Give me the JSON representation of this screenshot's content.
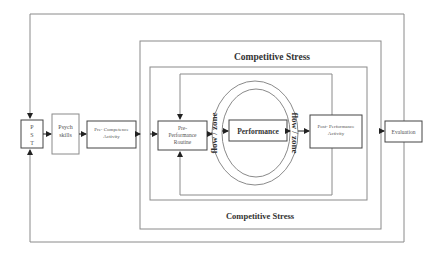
{
  "diagram": {
    "colors": {
      "line": "#8a8a8a",
      "box": "#444444",
      "text": "#555555",
      "bold_text": "#333333",
      "background": "#ffffff"
    },
    "stress_top_label": "Competitive Stress",
    "stress_bottom_label": "Competitive Stress",
    "boxes": {
      "pst": {
        "lines": [
          "P",
          "S",
          "T"
        ]
      },
      "psych": {
        "lines": [
          "Psych",
          "skills"
        ]
      },
      "pre_competence": {
        "lines": [
          "Pre- Competence",
          "Activity"
        ]
      },
      "pre_performance": {
        "lines": [
          "Pre-",
          "Performance",
          "Routine"
        ]
      },
      "performance": {
        "label": "Performance"
      },
      "post_performance": {
        "lines": [
          "Post- Performance",
          "Activity"
        ]
      },
      "evaluation": {
        "label": "Evaluation"
      }
    },
    "flow_left": "flow / zone",
    "flow_right": "flow / zone"
  }
}
